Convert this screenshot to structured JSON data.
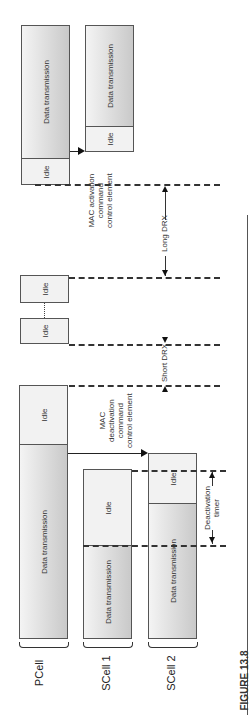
{
  "figure": {
    "caption": "FIGURE 13.8",
    "cells": [
      "PCell",
      "SCell 1",
      "SCell 2"
    ],
    "blocks": {
      "data": "Data transmission",
      "idle": "Idle"
    },
    "annotations": {
      "mac_activation": [
        "MAC activation",
        "command",
        "control element"
      ],
      "mac_deactivation": [
        "MAC",
        "deactivation",
        "command",
        "control element"
      ],
      "short_drx": "Short DRX",
      "long_drx": "Long DRX",
      "deactivation_timer": [
        "Deactivation",
        "timer"
      ]
    }
  }
}
